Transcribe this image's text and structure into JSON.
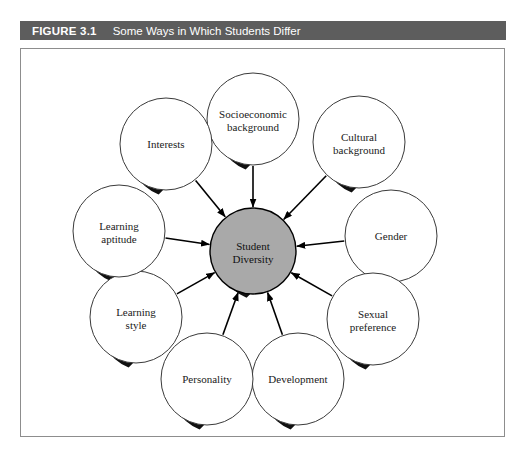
{
  "figure": {
    "label": "FIGURE 3.1",
    "title": "Some Ways in Which Students Differ"
  },
  "diagram": {
    "type": "hub-and-spoke",
    "hub": {
      "name": "student-diversity",
      "line1": "Student",
      "line2": "Diversity",
      "fill": "#a9a9a9",
      "stroke": "#000000",
      "cx": 232,
      "cy": 202,
      "r": 43
    },
    "arrow_direction": "inward",
    "colors": {
      "node_fill": "#ffffff",
      "node_stroke": "#3a3a3a",
      "shadow": "#101010",
      "connector": "#000000",
      "caption_bar": "#5d5d5d",
      "frame_border": "#8d8d8d"
    },
    "nodes": [
      {
        "name": "socioeconomic-background",
        "line1": "Socioeconomic",
        "line2": "background",
        "cx": 232,
        "cy": 70,
        "r": 46,
        "angle": -90
      },
      {
        "name": "cultural-background",
        "line1": "Cultural",
        "line2": "background",
        "cx": 338,
        "cy": 93,
        "r": 46,
        "angle": -45
      },
      {
        "name": "gender",
        "line1": "Gender",
        "line2": "",
        "cx": 370,
        "cy": 187,
        "r": 46,
        "angle": -8
      },
      {
        "name": "sexual-preference",
        "line1": "Sexual",
        "line2": "preference",
        "cx": 352,
        "cy": 270,
        "r": 46,
        "angle": 40
      },
      {
        "name": "development",
        "line1": "Development",
        "line2": "",
        "cx": 277,
        "cy": 330,
        "r": 46,
        "angle": 73
      },
      {
        "name": "personality",
        "line1": "Personality",
        "line2": "",
        "cx": 186,
        "cy": 330,
        "r": 46,
        "angle": 107
      },
      {
        "name": "learning-style",
        "line1": "Learning",
        "line2": "style",
        "cx": 115,
        "cy": 268,
        "r": 46,
        "angle": 140
      },
      {
        "name": "learning-aptitude",
        "line1": "Learning",
        "line2": "aptitude",
        "cx": 98,
        "cy": 182,
        "r": 46,
        "angle": 185
      },
      {
        "name": "interests",
        "line1": "Interests",
        "line2": "",
        "cx": 145,
        "cy": 95,
        "r": 46,
        "angle": -135
      }
    ]
  }
}
